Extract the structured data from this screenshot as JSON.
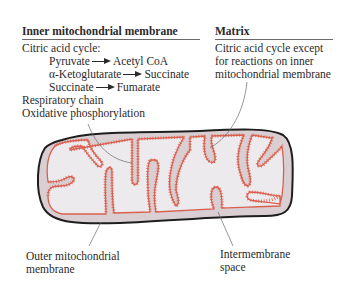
{
  "diagram": {
    "type": "labeled-illustration",
    "colors": {
      "outer_membrane": "#1e1e1e",
      "intermembrane_space": "#d9cfd3",
      "inner_membrane": "#d9604f",
      "matrix": "#eceaec",
      "leader_line": "#6a6a6a",
      "text": "#2a2a2a"
    }
  },
  "inner_membrane_panel": {
    "heading": "Inner mitochondrial membrane",
    "intro": "Citric acid cycle:",
    "reactions": [
      {
        "from": "Pyruvate",
        "to": "Acetyl CoA"
      },
      {
        "from": "α-Ketoglutarate",
        "to": "Succinate"
      },
      {
        "from": "Succinate",
        "to": "Fumarate"
      }
    ],
    "extra_items": [
      "Respiratory chain",
      "Oxidative phosphorylation"
    ]
  },
  "matrix_panel": {
    "heading": "Matrix",
    "lines": [
      "Citric acid cycle except",
      "for reactions on inner",
      "mitochondrial membrane"
    ]
  },
  "bottom_labels": {
    "outer_membrane": [
      "Outer mitochondrial",
      "membrane"
    ],
    "intermembrane_space": [
      "Intermembrane",
      "space"
    ]
  }
}
